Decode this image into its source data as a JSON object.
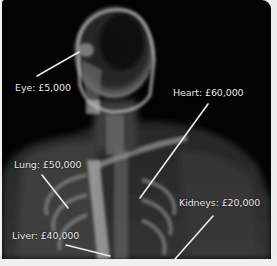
{
  "infographic": {
    "subject": "human-body-xray",
    "labels": [
      {
        "id": "eye",
        "text": "Eye: £5,000",
        "x": 13,
        "y": 82
      },
      {
        "id": "heart",
        "text": "Heart: £60,000",
        "x": 171,
        "y": 87
      },
      {
        "id": "lung",
        "text": "Lung: £50,000",
        "x": 12,
        "y": 159
      },
      {
        "id": "kidneys",
        "text": "Kidneys: £20,000",
        "x": 177,
        "y": 197
      },
      {
        "id": "liver",
        "text": "Liver: £40,000",
        "x": 10,
        "y": 230
      }
    ],
    "colors": {
      "background": "#030303",
      "label_text": "#e6e6e6",
      "leader_line": "#ececec",
      "frame": "#f1f1f1"
    }
  }
}
